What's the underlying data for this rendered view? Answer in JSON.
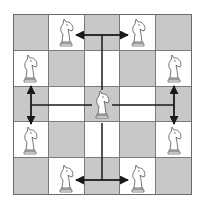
{
  "diagram": {
    "board": {
      "rows": 5,
      "cols": 5,
      "colors": {
        "dark": "#c8c8c8",
        "light": "#ffffff",
        "line": "#7a7a7a",
        "arrow": "#1a1a1a"
      },
      "pattern": [
        [
          "dark",
          "light",
          "dark",
          "light",
          "dark"
        ],
        [
          "light",
          "dark",
          "light",
          "dark",
          "light"
        ],
        [
          "dark",
          "light",
          "dark",
          "light",
          "dark"
        ],
        [
          "light",
          "dark",
          "light",
          "dark",
          "light"
        ],
        [
          "dark",
          "light",
          "dark",
          "light",
          "dark"
        ]
      ]
    },
    "center_piece": {
      "type": "knight",
      "color": "white",
      "row": 2,
      "col": 2
    },
    "target_pieces": [
      {
        "type": "knight",
        "color": "white",
        "row": 0,
        "col": 1
      },
      {
        "type": "knight",
        "color": "white",
        "row": 0,
        "col": 3
      },
      {
        "type": "knight",
        "color": "white",
        "row": 1,
        "col": 0
      },
      {
        "type": "knight",
        "color": "white",
        "row": 1,
        "col": 4
      },
      {
        "type": "knight",
        "color": "white",
        "row": 3,
        "col": 0
      },
      {
        "type": "knight",
        "color": "white",
        "row": 3,
        "col": 4
      },
      {
        "type": "knight",
        "color": "white",
        "row": 4,
        "col": 1
      },
      {
        "type": "knight",
        "color": "white",
        "row": 4,
        "col": 3
      }
    ],
    "move_paths": [
      {
        "direction": "up",
        "branch_to": [
          "row0-col1",
          "row0-col3"
        ]
      },
      {
        "direction": "down",
        "branch_to": [
          "row4-col1",
          "row4-col3"
        ]
      },
      {
        "direction": "left",
        "branch_to": [
          "row1-col0",
          "row3-col0"
        ]
      },
      {
        "direction": "right",
        "branch_to": [
          "row1-col4",
          "row3-col4"
        ]
      }
    ]
  }
}
